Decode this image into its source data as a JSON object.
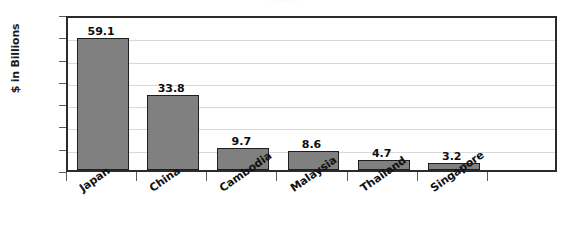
{
  "chart_data": {
    "type": "bar",
    "title": "",
    "title_fragment": "||||||||",
    "xlabel": "",
    "ylabel": "$ in Billions",
    "categories": [
      "Japan",
      "China",
      "Cambodia",
      "Malaysia",
      "Thailand",
      "Singapore"
    ],
    "values": [
      59.1,
      33.8,
      9.7,
      8.6,
      4.7,
      3.2
    ],
    "value_labels": [
      "59.1",
      "33.8",
      "9.7",
      "8.6",
      "4.7",
      "3.2"
    ],
    "ylim": [
      0,
      70
    ],
    "ytick_labels": [
      "70",
      "60",
      "50",
      "40",
      "30",
      "20",
      "10",
      "0"
    ],
    "ytick_values": [
      70,
      60,
      50,
      40,
      30,
      20,
      10,
      0
    ],
    "grid": true,
    "legend": false,
    "bar_color": "#808080",
    "bar_border_color": "#1f1f1f",
    "gridline_color": "#d9d9d9",
    "axis_color": "#2b2b2b",
    "text_color": "#111111"
  }
}
